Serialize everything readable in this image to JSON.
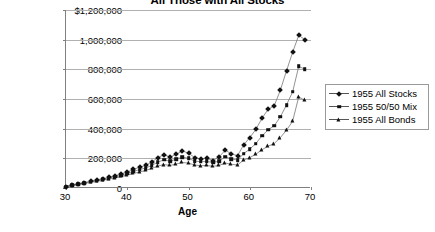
{
  "chart_data": {
    "type": "line",
    "title": "All Those with All Stocks",
    "xlabel": "Age",
    "ylabel": "",
    "xlim": [
      30,
      70
    ],
    "ylim": [
      0,
      1200000
    ],
    "grid": true,
    "legend_position": "right",
    "x_ticks": [
      "30",
      "40",
      "50",
      "60",
      "70"
    ],
    "x_tick_values": [
      30,
      40,
      50,
      60,
      70
    ],
    "y_ticks": [
      "0",
      "200,000",
      "400,000",
      "600,000",
      "800,000",
      "1,000,000",
      "$1,200,000"
    ],
    "y_tick_values": [
      0,
      200000,
      400000,
      600000,
      800000,
      1000000,
      1200000
    ],
    "x": [
      30,
      31,
      32,
      33,
      34,
      35,
      36,
      37,
      38,
      39,
      40,
      41,
      42,
      43,
      44,
      45,
      46,
      47,
      48,
      49,
      50,
      51,
      52,
      53,
      54,
      55,
      56,
      57,
      58,
      59,
      60,
      61,
      62,
      63,
      64,
      65,
      66,
      67,
      68,
      69
    ],
    "series": [
      {
        "name": "1955 All Stocks",
        "marker": "diamond",
        "values": [
          10000,
          20000,
          28000,
          36000,
          45000,
          55000,
          62000,
          72000,
          82000,
          95000,
          108000,
          125000,
          140000,
          152000,
          175000,
          205000,
          225000,
          208000,
          228000,
          250000,
          235000,
          205000,
          196000,
          200000,
          185000,
          210000,
          255000,
          230000,
          218000,
          290000,
          340000,
          395000,
          470000,
          530000,
          555000,
          660000,
          790000,
          915000,
          1030000,
          1000000
        ]
      },
      {
        "name": "1955 50/50 Mix",
        "marker": "square",
        "values": [
          10000,
          19000,
          26000,
          34000,
          42000,
          50000,
          58000,
          66000,
          76000,
          87000,
          98000,
          112000,
          124000,
          135000,
          152000,
          175000,
          190000,
          180000,
          195000,
          208000,
          200000,
          182000,
          176000,
          180000,
          170000,
          182000,
          210000,
          196000,
          188000,
          232000,
          262000,
          300000,
          352000,
          392000,
          420000,
          480000,
          560000,
          648000,
          820000,
          800000
        ]
      },
      {
        "name": "1955 All Bonds",
        "marker": "triangle",
        "values": [
          9000,
          17000,
          24000,
          31000,
          38000,
          45000,
          52000,
          60000,
          68000,
          78000,
          88000,
          98000,
          108000,
          118000,
          132000,
          148000,
          158000,
          152000,
          162000,
          172000,
          168000,
          155000,
          150000,
          152000,
          146000,
          152000,
          168000,
          160000,
          155000,
          188000,
          205000,
          228000,
          258000,
          282000,
          300000,
          340000,
          390000,
          450000,
          615000,
          590000
        ]
      }
    ]
  },
  "legend": {
    "items": [
      {
        "label": "1955 All Stocks"
      },
      {
        "label": "1955 50/50 Mix"
      },
      {
        "label": "1955 All Bonds"
      }
    ]
  }
}
